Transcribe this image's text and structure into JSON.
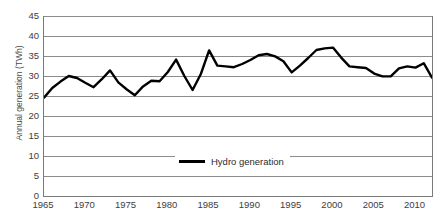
{
  "chart_data": {
    "type": "line",
    "title": "",
    "xlabel": "",
    "ylabel": "Annual generation (TWh)",
    "ylim": [
      0,
      45
    ],
    "xlim": [
      1965,
      2012
    ],
    "y_ticks": [
      0,
      5,
      10,
      15,
      20,
      25,
      30,
      35,
      40,
      45
    ],
    "x_ticks": [
      1965,
      1970,
      1975,
      1980,
      1985,
      1990,
      1995,
      2000,
      2005,
      2010
    ],
    "grid": "horizontal",
    "legend_position": "bottom-center",
    "series": [
      {
        "name": "Hydro generation",
        "color": "#000000",
        "x": [
          1965,
          1966,
          1967,
          1968,
          1969,
          1970,
          1971,
          1972,
          1973,
          1974,
          1975,
          1976,
          1977,
          1978,
          1979,
          1980,
          1981,
          1982,
          1983,
          1984,
          1985,
          1986,
          1987,
          1988,
          1989,
          1990,
          1991,
          1992,
          1993,
          1994,
          1995,
          1996,
          1997,
          1998,
          1999,
          2000,
          2001,
          2002,
          2003,
          2004,
          2005,
          2006,
          2007,
          2008,
          2009,
          2010,
          2011,
          2012
        ],
        "values": [
          24.6,
          27.0,
          28.6,
          30.0,
          29.5,
          28.3,
          27.2,
          29.2,
          31.4,
          28.4,
          26.7,
          25.2,
          27.4,
          28.8,
          28.7,
          31.0,
          34.1,
          30.0,
          26.5,
          30.5,
          36.4,
          32.6,
          32.4,
          32.2,
          33.0,
          34.0,
          35.2,
          35.5,
          34.9,
          33.7,
          30.9,
          32.6,
          34.5,
          36.5,
          36.9,
          37.1,
          34.6,
          32.4,
          32.2,
          32.0,
          30.6,
          29.9,
          29.9,
          31.9,
          32.4,
          32.1,
          33.2,
          29.6
        ]
      }
    ]
  },
  "legend": {
    "label": "Hydro generation"
  },
  "axis": {
    "y_title": "Annual generation (TWh)"
  }
}
